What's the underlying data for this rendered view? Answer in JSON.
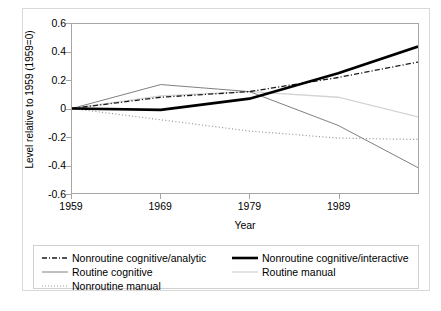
{
  "chart_data": {
    "type": "line",
    "title": "",
    "subtitle": "",
    "xlabel": "Year",
    "ylabel": "Level relative to 1959 (1959=0)",
    "x": [
      1959,
      1969,
      1979,
      1989,
      1998
    ],
    "xtick_labels": [
      "1959",
      "1969",
      "1979",
      "1989"
    ],
    "xtick_values": [
      1959,
      1969,
      1979,
      1989
    ],
    "ytick_labels": [
      "0.6",
      "0.4",
      "0.2",
      "0",
      "-0.2",
      "-0.4",
      "-0.6"
    ],
    "ytick_values": [
      0.6,
      0.4,
      0.2,
      0,
      -0.2,
      -0.4,
      -0.6
    ],
    "xlim": [
      1959,
      1998
    ],
    "ylim": [
      -0.6,
      0.6
    ],
    "grid": false,
    "legend_position": "bottom",
    "series": [
      {
        "name": "Nonroutine cognitive/analytic",
        "values": [
          0,
          0.08,
          0.12,
          0.22,
          0.33
        ],
        "color": "#1a1a1a",
        "style": "dashdot",
        "width": 1.3
      },
      {
        "name": "Nonroutine cognitive/interactive",
        "values": [
          0,
          -0.01,
          0.07,
          0.25,
          0.44
        ],
        "color": "#000000",
        "style": "solid",
        "width": 2.6
      },
      {
        "name": "Routine cognitive",
        "values": [
          0,
          0.17,
          0.12,
          -0.12,
          -0.42
        ],
        "color": "#808080",
        "style": "solid",
        "width": 1.0
      },
      {
        "name": "Routine manual",
        "values": [
          0,
          0.09,
          0.12,
          0.08,
          -0.06
        ],
        "color": "#d4d4d4",
        "style": "solid",
        "width": 1.3
      },
      {
        "name": "Nonroutine manual",
        "values": [
          0,
          -0.08,
          -0.16,
          -0.21,
          -0.22
        ],
        "color": "#9b9b9b",
        "style": "dotted",
        "width": 1.2
      }
    ],
    "legend_order": [
      "Nonroutine cognitive/analytic",
      "Nonroutine cognitive/interactive",
      "Routine cognitive",
      "Routine manual",
      "Nonroutine manual"
    ]
  },
  "axis": {
    "y_title": "Level relative to 1959 (1959=0)",
    "x_title": "Year",
    "y_labels": [
      "0.6",
      "0.4",
      "0.2",
      "0",
      "-0.2",
      "-0.4",
      "-0.6"
    ],
    "x_labels": [
      "1959",
      "1969",
      "1979",
      "1989"
    ]
  },
  "legend": {
    "items": [
      {
        "label": "Nonroutine cognitive/analytic"
      },
      {
        "label": "Nonroutine cognitive/interactive"
      },
      {
        "label": "Routine cognitive"
      },
      {
        "label": "Routine manual"
      },
      {
        "label": "Nonroutine manual"
      }
    ]
  }
}
